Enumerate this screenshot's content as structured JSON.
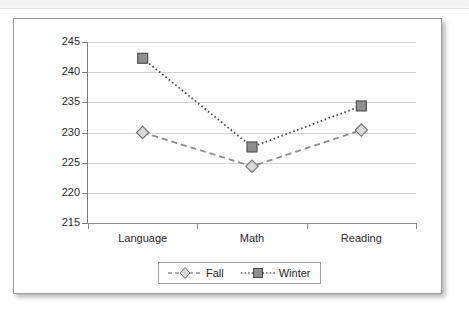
{
  "chart_data": {
    "type": "line",
    "title": "",
    "subtitle": "",
    "xlabel": "",
    "ylabel": "",
    "categories": [
      "Language",
      "Math",
      "Reading"
    ],
    "series": [
      {
        "name": "Fall",
        "values": [
          230.0,
          224.4,
          230.4
        ],
        "marker": "diamond",
        "line_style": "dashed",
        "color": "#8c8c8c",
        "marker_fill": "#d9d9d9",
        "marker_stroke": "#6e6e6e"
      },
      {
        "name": "Winter",
        "values": [
          242.3,
          227.6,
          234.4
        ],
        "marker": "square",
        "line_style": "dotted",
        "color": "#4d4d4d",
        "marker_fill": "#8f8f8f",
        "marker_stroke": "#4a4a4a"
      }
    ],
    "ylim": [
      215,
      245
    ],
    "ytick_step": 5,
    "yticks": [
      245,
      240,
      235,
      230,
      225,
      220,
      215
    ],
    "ytick_labels": [
      "245",
      "240",
      "235",
      "230",
      "225",
      "220",
      "215"
    ],
    "grid": true,
    "grid_axis": "y",
    "legend_position": "bottom-center",
    "legend_entries": [
      "Fall",
      "Winter"
    ]
  },
  "axes": {
    "y_labels": [
      "245",
      "240",
      "235",
      "230",
      "225",
      "220",
      "215"
    ],
    "x_labels": [
      "Language",
      "Math",
      "Reading"
    ]
  },
  "legend": {
    "items": [
      {
        "label": "Fall"
      },
      {
        "label": "Winter"
      }
    ]
  }
}
